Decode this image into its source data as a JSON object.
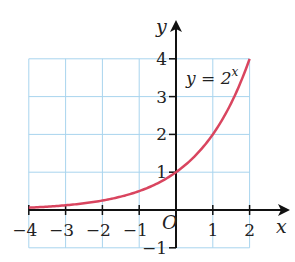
{
  "chart_data": {
    "type": "line",
    "title": "",
    "xlabel": "x",
    "ylabel": "y",
    "xlim": [
      -4,
      2
    ],
    "ylim": [
      -1,
      4
    ],
    "grid": true,
    "x_ticks": [
      "−4",
      "−3",
      "−2",
      "−1",
      "1",
      "2"
    ],
    "y_ticks": [
      "4",
      "3",
      "2",
      "1",
      "−1"
    ],
    "origin_label": "O",
    "annotation": {
      "text": "y = 2",
      "superscript": "x",
      "x": 0.3,
      "y": 3.6
    },
    "series": [
      {
        "name": "y = 2^x",
        "color": "#d9455f",
        "x": [
          -4,
          -3,
          -2,
          -1,
          0,
          1,
          2
        ],
        "values": [
          0.0625,
          0.125,
          0.25,
          0.5,
          1,
          2,
          4
        ]
      }
    ]
  },
  "colors": {
    "grid": "#a8d4ee",
    "axis": "#111111",
    "curve": "#d9455f"
  }
}
